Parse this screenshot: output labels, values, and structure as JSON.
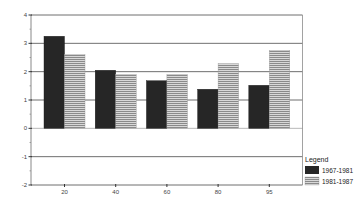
{
  "chart_data": {
    "type": "bar",
    "title": "",
    "xlabel": "",
    "ylabel": "",
    "categories": [
      "20",
      "40",
      "60",
      "80",
      "95"
    ],
    "series": [
      {
        "name": "1967-1981",
        "values": [
          3.25,
          2.05,
          1.68,
          1.38,
          1.52
        ],
        "color": "#262626",
        "pattern": "solid"
      },
      {
        "name": "1981-1987",
        "values": [
          2.6,
          1.9,
          1.9,
          2.28,
          2.75
        ],
        "color": "#b8b8b8",
        "pattern": "horizontal-stripes"
      }
    ],
    "ylim": [
      -2,
      4
    ],
    "yticks": [
      "4",
      "3",
      "2",
      "1",
      "0",
      "-1",
      "-2"
    ],
    "grid": true,
    "legend": {
      "title": "Legend",
      "position": "right-bottom"
    }
  },
  "legend": {
    "title": "Legend",
    "items": [
      {
        "label": "1967-1981"
      },
      {
        "label": "1981-1987"
      }
    ]
  }
}
